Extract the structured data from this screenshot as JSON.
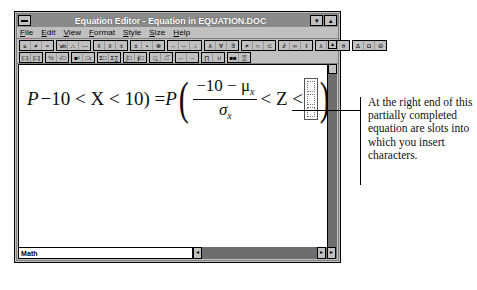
{
  "window": {
    "title": "Equation Editor - Equation in EQUATION.DOC",
    "sysmenu_icon": "system-menu-icon",
    "minimize_label": "▾",
    "maximize_label": "▴"
  },
  "menubar": {
    "items": [
      {
        "accel": "F",
        "rest": "ile"
      },
      {
        "accel": "E",
        "rest": "dit"
      },
      {
        "accel": "V",
        "rest": "iew"
      },
      {
        "accel": "F",
        "rest": "ormat"
      },
      {
        "accel": "S",
        "rest": "tyle"
      },
      {
        "accel": "S",
        "rest": "ize"
      },
      {
        "accel": "H",
        "rest": "elp"
      }
    ]
  },
  "toolbar": {
    "scroll_arrow": "▴",
    "row1": [
      {
        "name": "relational-symbols",
        "cells": [
          "≤",
          "≠",
          "≈"
        ]
      },
      {
        "name": "spaces-and-ellipses",
        "cells": [
          "˙ab",
          "∴",
          "⋯"
        ]
      },
      {
        "name": "embellishments",
        "cells": [
          "x̃",
          "x̂",
          "x̀"
        ]
      },
      {
        "name": "operator-symbols",
        "cells": [
          "±",
          "•",
          "⊗"
        ]
      },
      {
        "name": "arrow-symbols",
        "cells": [
          "→",
          "⇔",
          "↓"
        ]
      },
      {
        "name": "logical-symbols",
        "cells": [
          "∧",
          "∀",
          "∃"
        ]
      },
      {
        "name": "set-theory-symbols",
        "cells": [
          "≠",
          "∩",
          "⊂"
        ]
      },
      {
        "name": "miscellaneous-symbols",
        "cells": [
          "∂",
          "∞",
          "ℓ"
        ]
      },
      {
        "name": "greek-lowercase",
        "cells": [
          "λ",
          "ω",
          "θ"
        ]
      },
      {
        "name": "greek-uppercase",
        "cells": [
          "Δ",
          "Ω",
          "Θ"
        ]
      }
    ],
    "row2": [
      {
        "name": "fence-templates",
        "cells": [
          "(□)",
          "[□]"
        ]
      },
      {
        "name": "fraction-radical-templates",
        "cells": [
          "½",
          "√□"
        ]
      },
      {
        "name": "subscript-superscript-templates",
        "cells": [
          "■¹",
          "□ı"
        ]
      },
      {
        "name": "summation-templates",
        "cells": [
          "Σ□",
          "Σ∑"
        ]
      },
      {
        "name": "integral-templates",
        "cells": [
          "∫□",
          "∮□"
        ]
      },
      {
        "name": "underbar-overbar-templates",
        "cells": [
          "□̲",
          "□̅"
        ]
      },
      {
        "name": "labeled-arrow-templates",
        "cells": [
          "←",
          "→"
        ]
      },
      {
        "name": "product-set-theory-templates",
        "cells": [
          "∏",
          "∪"
        ]
      },
      {
        "name": "matrix-templates",
        "cells": [
          "■■",
          "▒"
        ]
      }
    ]
  },
  "equation": {
    "lead": "P",
    "expr_before": "−10 < X < 10) = ",
    "p_outer": "P",
    "paren_open": "(",
    "numerator": "−10 − μ",
    "numerator_sub": "x",
    "denominator": "σ",
    "denominator_sub": "x",
    "compare": "< Z <",
    "paren_close": ")",
    "slot_count": 3,
    "slot_placeholder": ""
  },
  "statusbar": {
    "style_label": "Math",
    "scroll_left": "◂",
    "scroll_right": "▸",
    "scroll_right2": "▸"
  },
  "annotation": {
    "text": "At the right end of this partially completed equation are slots into which you insert characters."
  },
  "colors": {
    "window_face": "#c0c0c0",
    "titlebar": "#8a8a8a",
    "canvas": "#ffffff",
    "scroll_track": "#6e6e6e",
    "text": "#000000"
  }
}
